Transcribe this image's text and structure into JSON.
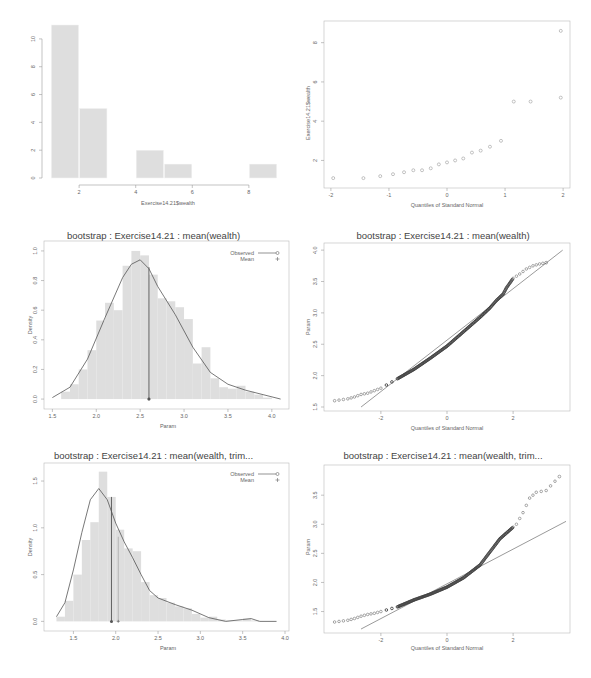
{
  "chart_data": [
    {
      "id": "hist-wealth",
      "type": "bar",
      "title": "",
      "xlabel": "Exercise14.21$wealth",
      "ylabel": "",
      "bins": [
        [
          1,
          2
        ],
        [
          2,
          3
        ],
        [
          3,
          4
        ],
        [
          4,
          5
        ],
        [
          5,
          6
        ],
        [
          6,
          7
        ],
        [
          7,
          8
        ],
        [
          8,
          9
        ]
      ],
      "values": [
        11,
        5,
        0,
        2,
        1,
        0,
        0,
        1
      ],
      "xticks": [
        2,
        4,
        6,
        8
      ],
      "yticks": [
        0,
        2,
        4,
        6,
        8,
        10
      ],
      "xlim": [
        0.9,
        9.1
      ],
      "ylim": [
        0,
        11
      ],
      "grid": false
    },
    {
      "id": "qq-wealth",
      "type": "scatter",
      "title": "",
      "xlabel": "Quantiles of Standard Normal",
      "ylabel": "Exercise14.21$wealth",
      "x": [
        -1.96,
        -1.44,
        -1.15,
        -0.93,
        -0.74,
        -0.58,
        -0.43,
        -0.28,
        -0.14,
        0.0,
        0.14,
        0.28,
        0.43,
        0.58,
        0.74,
        0.93,
        1.15,
        1.44,
        1.96
      ],
      "y": [
        1.1,
        1.1,
        1.2,
        1.3,
        1.4,
        1.5,
        1.5,
        1.6,
        1.8,
        1.9,
        2.0,
        2.1,
        2.4,
        2.5,
        2.7,
        3.0,
        5.0,
        5.0,
        5.2,
        8.6
      ],
      "xticks": [
        -2,
        -1,
        0,
        1,
        2
      ],
      "yticks": [
        2,
        4,
        6,
        8
      ],
      "xlim": [
        -2.05,
        2.05
      ],
      "ylim": [
        0.8,
        8.9
      ],
      "grid": false
    },
    {
      "id": "boot-mean-density",
      "type": "bar",
      "title": "bootstrap : Exercise14.21 : mean(wealth)",
      "xlabel": "Param",
      "ylabel": "Density",
      "bin_width": 0.1,
      "bin_starts": [
        1.6,
        1.7,
        1.8,
        1.9,
        2.0,
        2.1,
        2.2,
        2.3,
        2.4,
        2.5,
        2.6,
        2.7,
        2.8,
        2.9,
        3.0,
        3.1,
        3.2,
        3.3,
        3.4,
        3.5,
        3.6,
        3.7,
        3.8,
        3.9
      ],
      "values": [
        0.05,
        0.1,
        0.2,
        0.33,
        0.53,
        0.65,
        0.6,
        0.9,
        1.0,
        0.97,
        0.84,
        0.68,
        0.66,
        0.62,
        0.54,
        0.24,
        0.35,
        0.14,
        0.08,
        0.07,
        0.09,
        0.05,
        0.03,
        0.01
      ],
      "density_curve": {
        "x": [
          1.5,
          1.7,
          1.9,
          2.1,
          2.3,
          2.4,
          2.5,
          2.6,
          2.7,
          2.9,
          3.1,
          3.3,
          3.5,
          3.7,
          3.9,
          4.1
        ],
        "y": [
          0.01,
          0.08,
          0.27,
          0.55,
          0.82,
          0.91,
          0.94,
          0.88,
          0.76,
          0.57,
          0.35,
          0.18,
          0.1,
          0.06,
          0.03,
          0.0
        ]
      },
      "observed": 2.6,
      "mean": 2.6,
      "observed_height": 0.89,
      "legend": [
        {
          "label": "Observed",
          "symbol": "line-circle"
        },
        {
          "label": "Mean",
          "symbol": "plus"
        }
      ],
      "legend_position": "topright",
      "xticks": [
        1.5,
        2.0,
        2.5,
        3.0,
        3.5,
        4.0
      ],
      "xtick_labels": [
        "1.5",
        "2.0",
        "2.5",
        "3.0",
        "3.5",
        "4.0"
      ],
      "yticks": [
        0.0,
        0.2,
        0.4,
        0.6,
        0.8,
        1.0
      ],
      "ytick_labels": [
        "0.0",
        "0.2",
        "0.4",
        "0.6",
        "0.8",
        "1.0"
      ],
      "xlim": [
        1.45,
        4.15
      ],
      "ylim": [
        -0.04,
        1.04
      ],
      "grid": false
    },
    {
      "id": "boot-mean-qq",
      "type": "scatter",
      "title": "bootstrap : Exercise14.21 : mean(wealth)",
      "xlabel": "Quantiles of Standard Normal",
      "ylabel": "Param",
      "curve_points": {
        "x": [
          -3.4,
          -3.0,
          -2.8,
          -2.6,
          -2.4,
          -2.2,
          -2.0,
          -1.5,
          -1.0,
          -0.5,
          0.0,
          0.5,
          1.0,
          1.3,
          1.5,
          1.7,
          1.8,
          2.0,
          2.2,
          2.4,
          2.6,
          2.8,
          3.0
        ],
        "y": [
          1.6,
          1.63,
          1.66,
          1.7,
          1.72,
          1.76,
          1.8,
          1.95,
          2.1,
          2.28,
          2.47,
          2.7,
          2.93,
          3.08,
          3.2,
          3.3,
          3.4,
          3.55,
          3.62,
          3.7,
          3.75,
          3.78,
          3.8
        ]
      },
      "reference_line": {
        "x": [
          -2.6,
          3.5
        ],
        "y": [
          1.5,
          4.0
        ]
      },
      "xticks": [
        -2,
        0,
        2
      ],
      "yticks": [
        1.5,
        2.0,
        2.5,
        3.0,
        3.5,
        4.0
      ],
      "ytick_labels": [
        "1.5",
        "2.0",
        "2.5",
        "3.0",
        "3.5",
        "4.0"
      ],
      "xlim": [
        -3.6,
        3.6
      ],
      "ylim": [
        1.5,
        4.05
      ],
      "grid": false
    },
    {
      "id": "boot-trim-density",
      "type": "bar",
      "title": "bootstrap : Exercise14.21 : mean(wealth, trim...",
      "xlabel": "Param",
      "ylabel": "Density",
      "bin_width": 0.1,
      "bin_starts": [
        1.3,
        1.4,
        1.5,
        1.6,
        1.7,
        1.8,
        1.9,
        2.0,
        2.1,
        2.2,
        2.3,
        2.4,
        2.5,
        2.6,
        2.7,
        2.8,
        2.9,
        3.0,
        3.1,
        3.2,
        3.3,
        3.4,
        3.5,
        3.6
      ],
      "values": [
        0.05,
        0.22,
        0.5,
        0.87,
        1.06,
        1.6,
        1.33,
        0.98,
        0.78,
        0.75,
        0.42,
        0.28,
        0.25,
        0.2,
        0.16,
        0.14,
        0.08,
        0.04,
        0.05,
        0.02,
        0.01,
        0.01,
        0.03,
        0.01
      ],
      "density_curve": {
        "x": [
          1.3,
          1.4,
          1.5,
          1.6,
          1.7,
          1.8,
          1.9,
          2.0,
          2.1,
          2.2,
          2.3,
          2.4,
          2.5,
          2.7,
          2.9,
          3.1,
          3.3,
          3.5,
          3.6,
          3.7,
          3.9
        ],
        "y": [
          0.05,
          0.2,
          0.55,
          0.95,
          1.3,
          1.42,
          1.3,
          1.05,
          0.85,
          0.68,
          0.5,
          0.33,
          0.25,
          0.18,
          0.12,
          0.04,
          0.0,
          0.02,
          0.03,
          0.0,
          0.0
        ]
      },
      "observed": 1.95,
      "mean": 2.03,
      "observed_height": 1.33,
      "legend": [
        {
          "label": "Observed",
          "symbol": "line-circle"
        },
        {
          "label": "Mean",
          "symbol": "plus"
        }
      ],
      "legend_position": "topright",
      "xticks": [
        1.5,
        2.0,
        2.5,
        3.0,
        3.5,
        4.0
      ],
      "xtick_labels": [
        "1.5",
        "2.0",
        "2.5",
        "3.0",
        "3.5",
        "4.0"
      ],
      "yticks": [
        0.0,
        0.5,
        1.0,
        1.5
      ],
      "ytick_labels": [
        "0.0",
        "0.5",
        "1.0",
        "1.5"
      ],
      "xlim": [
        1.2,
        4.0
      ],
      "ylim": [
        -0.06,
        1.65
      ],
      "grid": false
    },
    {
      "id": "boot-trim-qq",
      "type": "scatter",
      "title": "bootstrap : Exercise14.21 : mean(wealth, trim...",
      "xlabel": "Quantiles of Standard Normal",
      "ylabel": "Param",
      "curve_points": {
        "x": [
          -3.4,
          -3.0,
          -2.8,
          -2.6,
          -2.4,
          -2.2,
          -2.0,
          -1.5,
          -1.0,
          -0.5,
          0.0,
          0.5,
          1.0,
          1.2,
          1.4,
          1.6,
          1.8,
          2.0,
          2.1,
          2.2,
          2.3,
          2.5,
          2.7,
          3.0,
          3.4
        ],
        "y": [
          1.32,
          1.35,
          1.38,
          1.42,
          1.45,
          1.47,
          1.5,
          1.58,
          1.7,
          1.8,
          1.92,
          2.08,
          2.3,
          2.45,
          2.6,
          2.75,
          2.85,
          2.95,
          3.0,
          3.1,
          3.2,
          3.45,
          3.55,
          3.58,
          3.82
        ]
      },
      "reference_line": {
        "x": [
          -2.6,
          3.6
        ],
        "y": [
          1.2,
          3.05
        ]
      },
      "xticks": [
        -2,
        0,
        2
      ],
      "yticks": [
        1.5,
        2.0,
        2.5,
        3.0,
        3.5
      ],
      "ytick_labels": [
        "1.5",
        "2.0",
        "2.5",
        "3.0",
        "3.5"
      ],
      "xlim": [
        -3.6,
        3.6
      ],
      "ylim": [
        1.2,
        3.95
      ],
      "grid": false
    }
  ],
  "panels": {
    "p1": {
      "title": "",
      "xlabel": "Exercise14.21$wealth",
      "ylabel": ""
    },
    "p2": {
      "title": "",
      "xlabel": "Quantiles of Standard Normal",
      "ylabel": "Exercise14.21$wealth"
    },
    "p3": {
      "title": "bootstrap : Exercise14.21 : mean(wealth)",
      "xlabel": "Param",
      "ylabel": "Density",
      "legend_observed": "Observed",
      "legend_mean": "Mean"
    },
    "p4": {
      "title": "bootstrap : Exercise14.21 : mean(wealth)",
      "xlabel": "Quantiles of Standard Normal",
      "ylabel": "Param"
    },
    "p5": {
      "title": "bootstrap : Exercise14.21 : mean(wealth, trim...",
      "xlabel": "Param",
      "ylabel": "Density",
      "legend_observed": "Observed",
      "legend_mean": "Mean"
    },
    "p6": {
      "title": "bootstrap : Exercise14.21 : mean(wealth, trim...",
      "xlabel": "Quantiles of Standard Normal",
      "ylabel": "Param"
    }
  },
  "colors": {
    "bar_fill": "#dedede",
    "bar_stroke": "#f4f4f4",
    "axis": "#9a9a9a",
    "curve": "#555555",
    "points": "#444444",
    "text": "#666666"
  }
}
